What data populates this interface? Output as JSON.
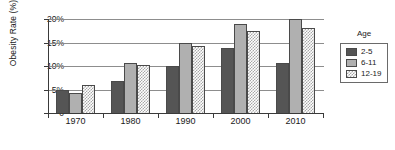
{
  "chart_data": {
    "type": "bar",
    "title": "",
    "xlabel": "",
    "ylabel": "Obesity Rate (%)",
    "categories": [
      "1970",
      "1980",
      "1990",
      "2000",
      "2010"
    ],
    "series": [
      {
        "name": "2-5",
        "values": [
          4.9,
          6.9,
          10.0,
          13.9,
          10.7
        ],
        "color": "#555555",
        "pattern": "solid-dark"
      },
      {
        "name": "6-11",
        "values": [
          4.2,
          10.7,
          15.0,
          19.0,
          19.9
        ],
        "color": "#b0b0b0",
        "pattern": "solid-light"
      },
      {
        "name": "12-19",
        "values": [
          5.9,
          10.2,
          14.2,
          17.4,
          18.0
        ],
        "color": "#a8a8a8",
        "pattern": "checkered"
      }
    ],
    "ylim": [
      0,
      20
    ],
    "yticks": [
      0,
      5,
      10,
      15,
      20
    ],
    "ytick_labels": [
      "0",
      "5%",
      "10%",
      "15%",
      "20%"
    ],
    "grid": "horizontal",
    "legend_position": "right",
    "legend_title": "Age"
  },
  "legend": {
    "title": "Age",
    "entries": [
      {
        "label": "2-5"
      },
      {
        "label": "6-11"
      },
      {
        "label": "12-19"
      }
    ]
  }
}
